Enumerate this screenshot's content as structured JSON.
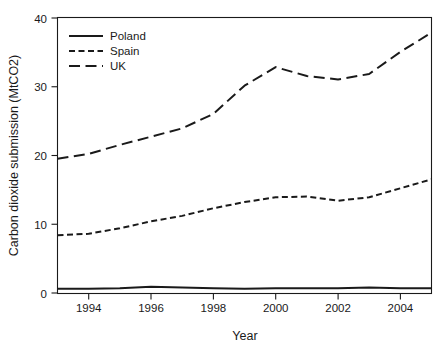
{
  "chart_data": {
    "type": "line",
    "title": "",
    "xlabel": "Year",
    "ylabel": "Carbon dioxide submission (MtCO2)",
    "xlim": [
      1993,
      2005
    ],
    "ylim": [
      0,
      40
    ],
    "xticks": [
      1994,
      1996,
      1998,
      2000,
      2002,
      2004
    ],
    "xtick_labels": [
      "1994",
      "1996",
      "1998",
      "2000",
      "2002",
      "2004"
    ],
    "yticks": [
      0,
      10,
      20,
      30,
      40
    ],
    "ytick_labels": [
      "0",
      "10",
      "20",
      "30",
      "40"
    ],
    "grid": false,
    "legend_position": "top-left",
    "x": [
      1993,
      1994,
      1995,
      1996,
      1997,
      1998,
      1999,
      2000,
      2001,
      2002,
      2003,
      2004,
      2005
    ],
    "series": [
      {
        "name": "Poland",
        "style": "solid",
        "color": "#1a1a1a",
        "values": [
          0.6,
          0.6,
          0.7,
          0.9,
          0.8,
          0.7,
          0.6,
          0.7,
          0.7,
          0.7,
          0.8,
          0.7,
          0.7
        ]
      },
      {
        "name": "Spain",
        "style": "short-dash",
        "color": "#1a1a1a",
        "values": [
          8.4,
          8.6,
          9.4,
          10.4,
          11.2,
          12.3,
          13.2,
          13.9,
          14.0,
          13.4,
          13.9,
          15.2,
          16.5
        ]
      },
      {
        "name": "UK",
        "style": "long-dash",
        "color": "#1a1a1a",
        "values": [
          19.5,
          20.2,
          21.5,
          22.7,
          23.9,
          26.0,
          30.1,
          32.8,
          31.5,
          31.0,
          31.8,
          35.0,
          37.8
        ]
      }
    ]
  },
  "legend": {
    "entries": [
      {
        "label": "Poland",
        "style": "solid"
      },
      {
        "label": "Spain",
        "style": "short-dash"
      },
      {
        "label": "UK",
        "style": "long-dash"
      }
    ]
  },
  "axes": {
    "x_title": "Year",
    "y_title": "Carbon dioxide submission (MtCO2)"
  }
}
